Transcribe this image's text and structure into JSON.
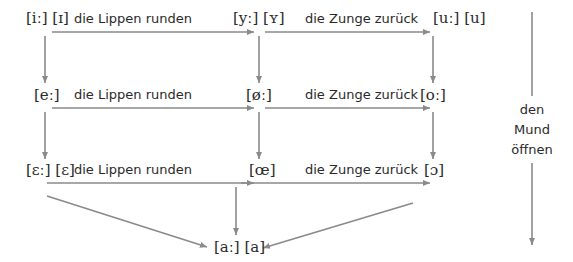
{
  "diagram": {
    "title": "",
    "arrow_color": "#8a8a8a",
    "text_color": "#2a2a2a",
    "rows": [
      {
        "front": "[iː] [ɪ]",
        "rounded": "[yː] [ʏ]",
        "back": "[uː] [u]",
        "label_round": "die Lippen runden",
        "label_back": "die Zunge zurück"
      },
      {
        "front": "[eː]",
        "rounded": "[øː]",
        "back": "[oː]",
        "label_round": "die Lippen runden",
        "label_back": "die Zunge zurück"
      },
      {
        "front": "[ɛː] [ɛ]",
        "rounded": "[œ]",
        "back": "[ɔ]",
        "label_round": "die Lippen runden",
        "label_back": "die Zunge zurück"
      }
    ],
    "bottom": "[aː] [a]",
    "side_label": {
      "line1": "den",
      "line2": "Mund",
      "line3": "öffnen"
    }
  }
}
